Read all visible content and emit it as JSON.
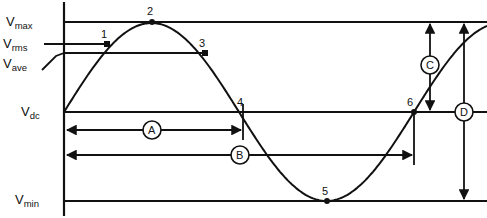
{
  "figure": {
    "background": "#ffffff",
    "stroke_color": "#111111"
  },
  "axis_labels": [
    {
      "name": "v-max",
      "base": "V",
      "sub": "max",
      "text": "Vmax",
      "x": 6,
      "y": 16,
      "level_y": 22
    },
    {
      "name": "v-rms",
      "base": "V",
      "sub": "rms",
      "text": "Vrms",
      "x": 4,
      "y": 38,
      "level_y": 44
    },
    {
      "name": "v-ave",
      "base": "V",
      "sub": "ave",
      "text": "Vave",
      "x": 4,
      "y": 58,
      "level_y": 53
    },
    {
      "name": "v-dc",
      "base": "V",
      "sub": "dc",
      "text": "Vdc",
      "x": 22,
      "y": 106,
      "level_y": 112
    },
    {
      "name": "v-min",
      "base": "V",
      "sub": "min",
      "text": "Vmin",
      "x": 16,
      "y": 194,
      "level_y": 201
    }
  ],
  "points": [
    {
      "id": "1",
      "label": "1",
      "marker": "square",
      "x": 107,
      "y": 44,
      "label_x": 101,
      "label_y": 30
    },
    {
      "id": "2",
      "label": "2",
      "marker": "dot",
      "x": 152,
      "y": 22,
      "label_x": 147,
      "label_y": 7
    },
    {
      "id": "3",
      "label": "3",
      "marker": "square",
      "x": 205,
      "y": 53,
      "label_x": 199,
      "label_y": 39
    },
    {
      "id": "4",
      "label": "4",
      "marker": "none",
      "x": 243,
      "y": 112,
      "label_x": 238,
      "label_y": 98
    },
    {
      "id": "5",
      "label": "5",
      "marker": "dot",
      "x": 327,
      "y": 201,
      "label_x": 322,
      "label_y": 187
    },
    {
      "id": "6",
      "label": "6",
      "marker": "dot",
      "x": 414,
      "y": 112,
      "label_x": 408,
      "label_y": 98
    }
  ],
  "dimensions": [
    {
      "id": "A",
      "label": "A",
      "orientation": "horizontal",
      "from_x": 66,
      "to_x": 243,
      "y": 130,
      "label_x": 152,
      "label_y": 130,
      "radius": 9
    },
    {
      "id": "B",
      "label": "B",
      "orientation": "horizontal",
      "from_x": 66,
      "to_x": 414,
      "y": 155,
      "label_x": 240,
      "label_y": 155,
      "radius": 9
    },
    {
      "id": "C",
      "label": "C",
      "orientation": "vertical",
      "x": 430,
      "from_y": 22,
      "to_y": 112,
      "label_x": 430,
      "label_y": 65,
      "radius": 9
    },
    {
      "id": "D",
      "label": "D",
      "orientation": "vertical",
      "x": 464,
      "from_y": 22,
      "to_y": 201,
      "label_x": 464,
      "label_y": 112,
      "radius": 9
    }
  ],
  "waveform": {
    "name": "sine-wave",
    "start_x": 64,
    "end_x": 487,
    "baseline_y": 112,
    "amplitude": 89,
    "period_px": 350,
    "description": "One cycle of a sine wave starting at Vdc, peaking at Vmax, crossing Vdc, troughing at Vmin, returning to Vdc"
  },
  "level_lines": [
    {
      "name": "vmax-line",
      "from_x": 64,
      "to_x": 487,
      "y": 22
    },
    {
      "name": "vrms-line",
      "from_x": 44,
      "to_x": 107,
      "y": 44
    },
    {
      "name": "vave-line",
      "from_x": 64,
      "to_x": 205,
      "y": 53
    },
    {
      "name": "vdc-line",
      "from_x": 64,
      "to_x": 487,
      "y": 112
    },
    {
      "name": "vmin-line",
      "from_x": 64,
      "to_x": 487,
      "y": 201
    }
  ],
  "vertical_axis": {
    "name": "y-axis",
    "x": 64,
    "from_y": 2,
    "to_y": 216
  }
}
